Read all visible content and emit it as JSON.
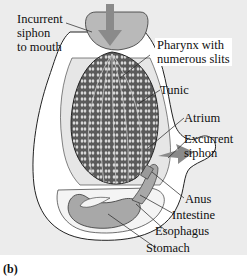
{
  "figure": {
    "panel_letter": "(b)",
    "colors": {
      "background": "#ececec",
      "tunic": "#ffffff",
      "siphon_fill": "#b9b9b9",
      "arrow": "#8a8a8a",
      "pharynx_dark": "#3a3a3a",
      "gut": "#a8a8a8",
      "outline": "#222222"
    }
  },
  "labels": {
    "incurrent": "Incurrent\nsiphon\nto mouth",
    "pharynx": "Pharynx with\nnumerous slits",
    "tunic": "Tunic",
    "atrium": "Atrium",
    "excurrent": "Excurrent\nsiphon",
    "anus": "Anus",
    "intestine": "Intestine",
    "esophagus": "Esophagus",
    "stomach": "Stomach"
  }
}
